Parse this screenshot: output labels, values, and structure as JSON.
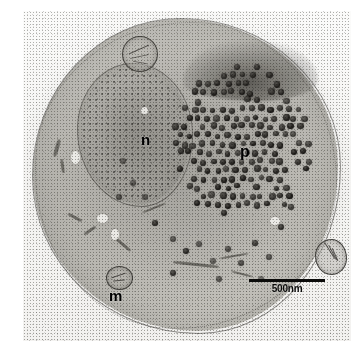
{
  "figure": {
    "type": "transmission-electron-micrograph",
    "caption_absent": true,
    "background_color": "#ffffff",
    "plate_tone": "grayscale"
  },
  "micrograph": {
    "title": "",
    "specimen": "thin-sectioned virus-infected cell",
    "staining": "electron-dense negative/heavy-metal contrast",
    "frame": {
      "left": 23,
      "top": 11,
      "width": 328,
      "height": 330
    }
  },
  "labels": [
    {
      "id": "n",
      "text": "n",
      "meaning": "nucleus",
      "x": 118,
      "y": 121,
      "font_size": 15,
      "color": "#000000"
    },
    {
      "id": "p",
      "text": "p",
      "meaning": "paracrystalline virus particle array",
      "x": 217,
      "y": 133,
      "font_size": 16,
      "color": "#000000"
    },
    {
      "id": "m",
      "text": "m",
      "meaning": "mitochondrion",
      "x": 86,
      "y": 277,
      "font_size": 15,
      "color": "#000000"
    }
  ],
  "scale_bar": {
    "label": "500nm",
    "value": 500,
    "unit": "nm",
    "bar_length_px": 76,
    "x": 226,
    "y": 268,
    "color": "#0b0b0a"
  },
  "features": {
    "nucleus": {
      "x": 55,
      "y": 53,
      "width": 112,
      "height": 140,
      "description": "large round electron-lucent nucleus with granular chromatin and distinct nuclear envelope"
    },
    "virus_inclusion": {
      "x": 150,
      "y": 52,
      "width": 138,
      "height": 162,
      "particle_count": 168,
      "particle_diameter_px": 6,
      "description": "dense paracrystalline array of round electron-dense virions in the cytoplasm"
    },
    "organelles": [
      {
        "name": "mitochondrion-top",
        "x": 99,
        "y": 25,
        "diameter": 34
      },
      {
        "name": "mitochondrion-right",
        "x": 292,
        "y": 228,
        "diameter": 32
      },
      {
        "name": "mitochondrion-bottom-left",
        "x": 83,
        "y": 255,
        "diameter": 26
      }
    ]
  },
  "virions": {
    "seed": 20240617,
    "count": 168,
    "color_core": "#0e0d0c",
    "color_rim": "#4a4844"
  }
}
